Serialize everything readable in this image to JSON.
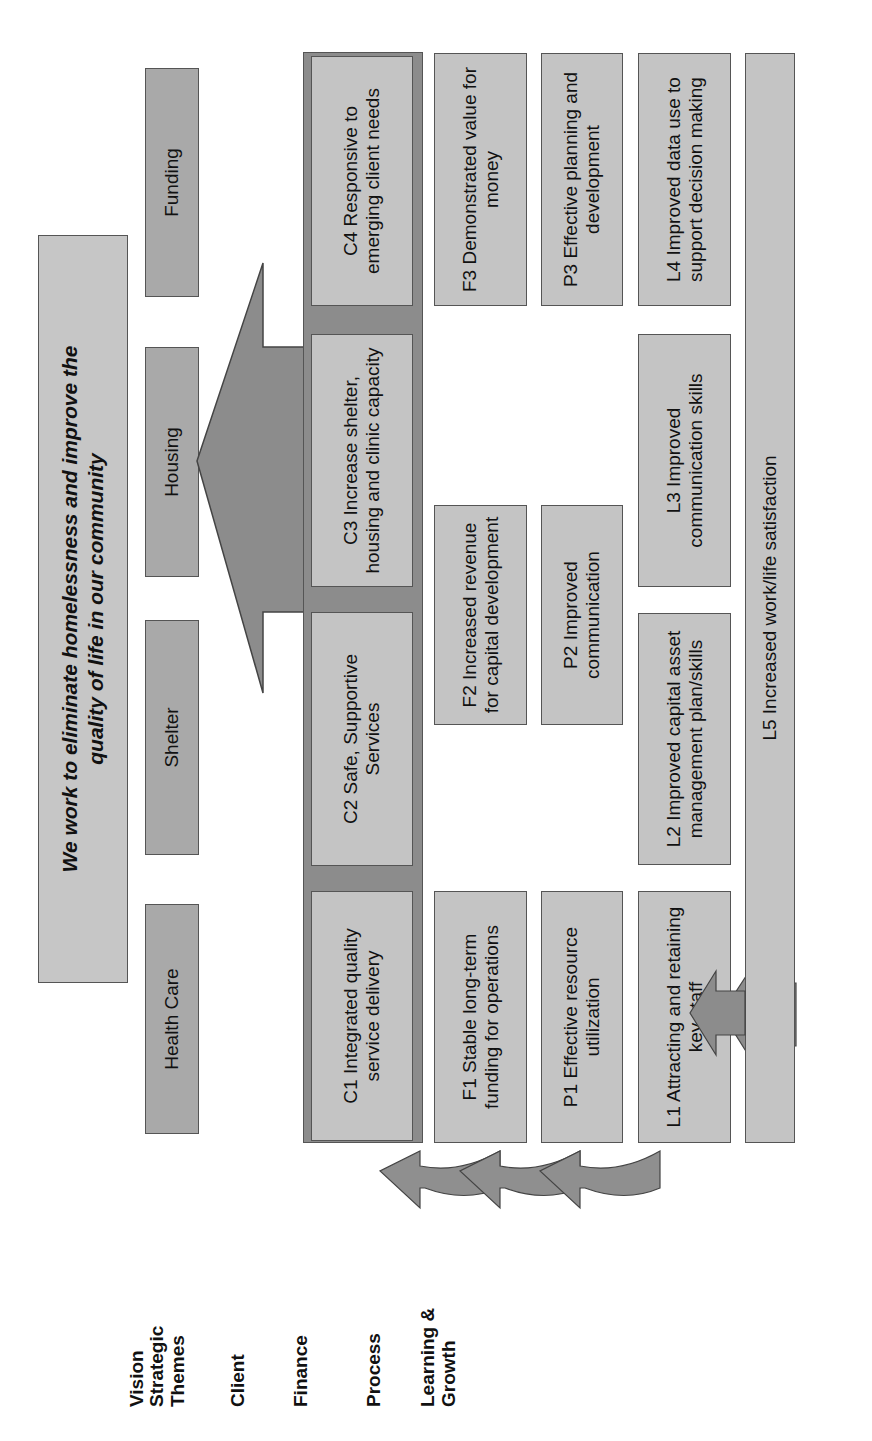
{
  "row_labels": {
    "vision": "Vision",
    "themes_line1": "Strategic",
    "themes_line2": "Themes",
    "client": "Client",
    "finance": "Finance",
    "process": "Process",
    "learning_line1": "Learning &",
    "learning_line2": "Growth"
  },
  "vision": {
    "line1": "We work to eliminate homelessness and improve the",
    "line2": "quality of life in our community"
  },
  "themes": [
    "Health Care",
    "Shelter",
    "Housing",
    "Funding"
  ],
  "client": {
    "c1": "C1 Integrated quality service delivery",
    "c2": "C2 Safe, Supportive Services",
    "c3": "C3 Increase shelter, housing and clinic capacity",
    "c4": "C4 Responsive to emerging client needs"
  },
  "finance": {
    "f1": "F1 Stable long-term funding for operations",
    "f2": "F2 Increased revenue for capital development",
    "f3": "F3 Demonstrated value for money"
  },
  "process": {
    "p1": "P1 Effective resource utilization",
    "p2": "P2 Improved communication",
    "p3": "P3 Effective planning and development"
  },
  "learning": {
    "l1": "L1 Attracting and retaining key staff",
    "l2": "L2 Improved capital asset management plan/skills",
    "l3": "L3 Improved communication skills",
    "l4": "L4 Improved data use to support decision making",
    "l5": "L5 Increased work/life satisfaction"
  },
  "colors": {
    "box_light": "#c4c4c4",
    "box_theme": "#a9a9a9",
    "band_dark": "#8c8c8c",
    "arrow": "#8f8f8f",
    "border": "#555555"
  },
  "orientation": "rotated 90° counter-clockwise"
}
